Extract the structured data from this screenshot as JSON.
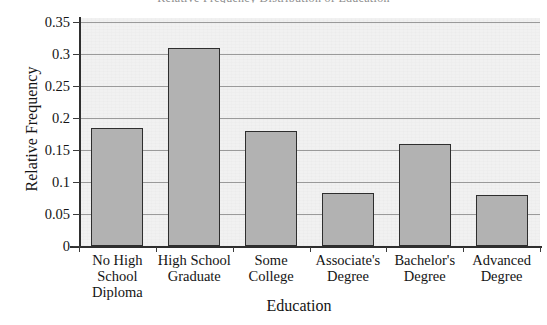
{
  "chart_data": {
    "type": "bar",
    "title": "Relative Frequency Distribution of Education",
    "xlabel": "Education",
    "ylabel": "Relative Frequency",
    "categories": [
      "No High School Diploma",
      "High School Graduate",
      "Some College",
      "Associate's Degree",
      "Bachelor's Degree",
      "Advanced Degree"
    ],
    "category_lines": [
      [
        "No High",
        "School",
        "Diploma"
      ],
      [
        "High School",
        "Graduate"
      ],
      [
        "Some",
        "College"
      ],
      [
        "Associate's",
        "Degree"
      ],
      [
        "Bachelor's",
        "Degree"
      ],
      [
        "Advanced",
        "Degree"
      ]
    ],
    "values": [
      0.185,
      0.31,
      0.18,
      0.083,
      0.16,
      0.08
    ],
    "ylim": [
      0,
      0.35
    ],
    "ytick_values": [
      0,
      0.05,
      0.1,
      0.15,
      0.2,
      0.25,
      0.3,
      0.35
    ],
    "ytick_labels": [
      "0",
      "0.05",
      "0.1",
      "0.15",
      "0.2",
      "0.25",
      "0.3",
      "0.35"
    ],
    "grid": true,
    "legend": false,
    "bar_color": "#b2b2b2",
    "bar_edge_color": "#2e2e2e",
    "plot_background": "#f1f1f1",
    "gridline_color": "#9a9a9a",
    "axis_color": "#2f2f2f"
  }
}
